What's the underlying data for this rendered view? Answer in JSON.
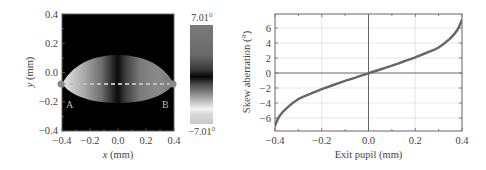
{
  "figure": {
    "left_panel": {
      "xlabel_italic": "x",
      "xlabel_unit": " (mm)",
      "ylabel_italic": "y",
      "ylabel_unit": " (mm)",
      "xticks": [
        "-0.4",
        "-0.2",
        "0.0",
        "0.2",
        "0.4"
      ],
      "yticks": [
        "0.4",
        "0.2",
        "0.0",
        "-0.2",
        "-0.4"
      ],
      "point_a_label": "A",
      "point_b_label": "B",
      "colorbar_max_label": "7.01°",
      "colorbar_min_label": "-7.01°"
    },
    "right_panel": {
      "xlabel": "Exit pupil (mm)",
      "ylabel": "Skew aberration (°)",
      "xticks": [
        "-0.4",
        "-0.2",
        "0.0",
        "0.2",
        "0.4"
      ],
      "yticks": [
        "6",
        "4",
        "2",
        "0",
        "-2",
        "-4",
        "-6"
      ]
    }
  },
  "chart_data": [
    {
      "type": "heatmap",
      "title": "",
      "xlabel": "x (mm)",
      "ylabel": "y (mm)",
      "xlim": [
        -0.4,
        0.4
      ],
      "ylim": [
        -0.4,
        0.4
      ],
      "xticks": [
        -0.4,
        -0.2,
        0.0,
        0.2,
        0.4
      ],
      "yticks": [
        -0.4,
        -0.2,
        0.0,
        0.2,
        0.4
      ],
      "colorbar": {
        "min": -7.01,
        "max": 7.01,
        "unit": "°",
        "min_label": "-7.01°",
        "max_label": "7.01°"
      },
      "annotations": [
        {
          "label": "A",
          "x": -0.4,
          "y": -0.08
        },
        {
          "label": "B",
          "x": 0.4,
          "y": -0.08
        }
      ],
      "dashed_line": {
        "from": [
          -0.4,
          -0.08
        ],
        "to": [
          0.4,
          -0.08
        ]
      },
      "region": "lens-shaped pupil spanning x -0.4..0.4, y approx -0.19..0.16",
      "grid": false
    },
    {
      "type": "line",
      "title": "",
      "xlabel": "Exit pupil (mm)",
      "ylabel": "Skew aberration (°)",
      "xlim": [
        -0.4,
        0.4
      ],
      "ylim": [
        -7.6,
        7.8
      ],
      "xticks": [
        -0.4,
        -0.2,
        0.0,
        0.2,
        0.4
      ],
      "yticks": [
        -6,
        -4,
        -2,
        0,
        2,
        4,
        6
      ],
      "grid": true,
      "series": [
        {
          "name": "Skew aberration",
          "x": [
            -0.4,
            -0.38,
            -0.35,
            -0.3,
            -0.25,
            -0.2,
            -0.15,
            -0.1,
            -0.05,
            0.0,
            0.05,
            0.1,
            0.15,
            0.2,
            0.25,
            0.3,
            0.35,
            0.38,
            0.4
          ],
          "y": [
            -6.9,
            -5.6,
            -4.6,
            -3.4,
            -2.7,
            -2.1,
            -1.55,
            -1.0,
            -0.5,
            0.0,
            0.5,
            1.0,
            1.55,
            2.1,
            2.7,
            3.4,
            4.6,
            5.7,
            7.0
          ]
        }
      ]
    }
  ]
}
